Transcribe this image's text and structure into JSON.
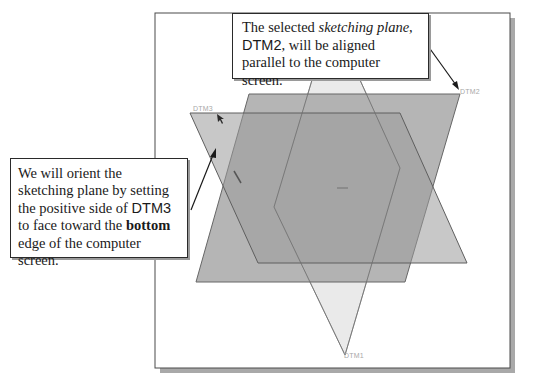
{
  "diagram": {
    "frame": {
      "border_color": "#4a4a4a",
      "shadow_color": "#a9a9a9",
      "background": "#ffffff"
    },
    "planes": [
      {
        "id": "DTM1",
        "label": "DTM1",
        "fill": "#e6e6e6",
        "stroke": "#8a8a8a"
      },
      {
        "id": "DTM2",
        "label": "DTM2",
        "fill": "#a4a4a4",
        "stroke": "#6d6d6d"
      },
      {
        "id": "DTM3",
        "label": "DTM3",
        "fill": "#bdbdbd",
        "stroke": "#6a6a6a"
      }
    ],
    "callouts": {
      "top": {
        "part1": "The selected ",
        "part2_italic": "sketching plane",
        "part3": ",",
        "part4_sans": "DTM2",
        "part5": ", will be aligned parallel to the computer screen."
      },
      "left": {
        "part1": "We will orient the sketching plane by setting the positive side of ",
        "part2_sans": "DTM3",
        "part3": " to face toward the ",
        "part4_bold": "bottom",
        "part5": " edge of the computer screen."
      }
    }
  }
}
